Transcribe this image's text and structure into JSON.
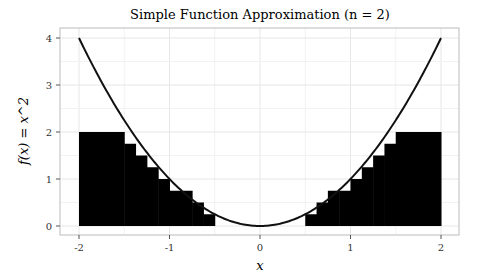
{
  "chart_data": {
    "type": "line",
    "title": "Simple Function Approximation (n = 2)",
    "xlabel": "x",
    "ylabel": "f(x) = x^2",
    "xlim": [
      -2,
      2
    ],
    "ylim": [
      0,
      4
    ],
    "xticks": [
      -2,
      -1,
      0,
      1,
      2
    ],
    "yticks": [
      0,
      1,
      2,
      3,
      4
    ],
    "grid": true,
    "series": [
      {
        "name": "f(x) = x^2",
        "kind": "curve",
        "color": "#111111"
      },
      {
        "name": "simple function (n=2)",
        "kind": "filled-steps",
        "color": "#000000",
        "step_width": 0.125,
        "left_steps": [
          {
            "x0": -2.0,
            "x1": -1.5,
            "y": 2.0
          },
          {
            "x0": -1.5,
            "x1": -1.375,
            "y": 1.75
          },
          {
            "x0": -1.375,
            "x1": -1.25,
            "y": 1.5
          },
          {
            "x0": -1.25,
            "x1": -1.125,
            "y": 1.25
          },
          {
            "x0": -1.125,
            "x1": -1.0,
            "y": 1.0
          },
          {
            "x0": -1.0,
            "x1": -0.875,
            "y": 0.75
          },
          {
            "x0": -0.875,
            "x1": -0.75,
            "y": 0.75
          },
          {
            "x0": -0.75,
            "x1": -0.625,
            "y": 0.5
          },
          {
            "x0": -0.625,
            "x1": -0.5,
            "y": 0.25
          }
        ]
      }
    ]
  }
}
